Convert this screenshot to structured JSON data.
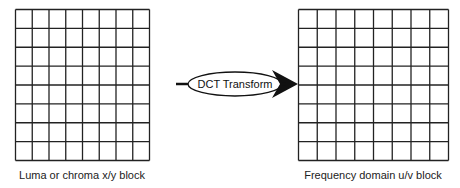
{
  "diagram": {
    "left_block": {
      "label": "Luma or chroma x/y block",
      "rows": 8,
      "cols": 8
    },
    "right_block": {
      "label": "Frequency domain u/v block",
      "rows": 8,
      "cols": 8
    },
    "transform": {
      "label": "DCT Transform"
    }
  },
  "colors": {
    "line": "#222222",
    "background": "#ffffff"
  }
}
